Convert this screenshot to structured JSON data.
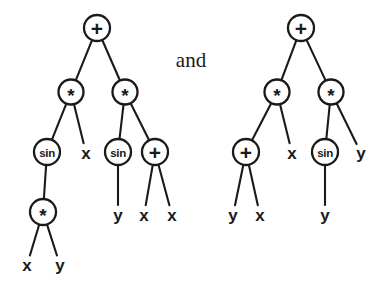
{
  "figure": {
    "caption_between": "and",
    "background_color": "#ffffff",
    "ink_color": "#1a1a1a",
    "trees": [
      {
        "id": "left-tree",
        "expression": "(+ (* (sin (* x y)) x) (* (sin y) (+ x x)))",
        "nodes": [
          {
            "id": "L0",
            "label": "+",
            "kind": "operator",
            "shape": "circle",
            "cx": 97,
            "cy": 28,
            "r": 13
          },
          {
            "id": "L1",
            "label": "*",
            "kind": "operator",
            "shape": "circle",
            "cx": 71,
            "cy": 92,
            "r": 12.5
          },
          {
            "id": "L2",
            "label": "*",
            "kind": "operator",
            "shape": "circle",
            "cx": 125,
            "cy": 92,
            "r": 12.5
          },
          {
            "id": "L3",
            "label": "sin",
            "kind": "operator",
            "shape": "circle",
            "cx": 47,
            "cy": 152,
            "r": 13
          },
          {
            "id": "L4",
            "label": "x",
            "kind": "terminal",
            "shape": "text",
            "cx": 86,
            "cy": 153
          },
          {
            "id": "L5",
            "label": "sin",
            "kind": "operator",
            "shape": "circle",
            "cx": 118,
            "cy": 152,
            "r": 13
          },
          {
            "id": "L6",
            "label": "+",
            "kind": "operator",
            "shape": "circle",
            "cx": 155,
            "cy": 152,
            "r": 13
          },
          {
            "id": "L7",
            "label": "*",
            "kind": "operator",
            "shape": "circle",
            "cx": 43,
            "cy": 212,
            "r": 13
          },
          {
            "id": "L8",
            "label": "y",
            "kind": "terminal",
            "shape": "text",
            "cx": 118,
            "cy": 215
          },
          {
            "id": "L9",
            "label": "x",
            "kind": "terminal",
            "shape": "text",
            "cx": 144,
            "cy": 215
          },
          {
            "id": "L10",
            "label": "x",
            "kind": "terminal",
            "shape": "text",
            "cx": 172,
            "cy": 215
          },
          {
            "id": "L11",
            "label": "x",
            "kind": "terminal",
            "shape": "text",
            "cx": 27,
            "cy": 265
          },
          {
            "id": "L12",
            "label": "y",
            "kind": "terminal",
            "shape": "text",
            "cx": 60,
            "cy": 265
          }
        ],
        "edges": [
          {
            "from": "L0",
            "to": "L1"
          },
          {
            "from": "L0",
            "to": "L2"
          },
          {
            "from": "L1",
            "to": "L3"
          },
          {
            "from": "L1",
            "to": "L4"
          },
          {
            "from": "L2",
            "to": "L5"
          },
          {
            "from": "L2",
            "to": "L6"
          },
          {
            "from": "L3",
            "to": "L7"
          },
          {
            "from": "L5",
            "to": "L8"
          },
          {
            "from": "L6",
            "to": "L9"
          },
          {
            "from": "L6",
            "to": "L10"
          },
          {
            "from": "L7",
            "to": "L11"
          },
          {
            "from": "L7",
            "to": "L12"
          }
        ]
      },
      {
        "id": "right-tree",
        "expression": "(+ (* (+ y x) x) (* (sin y) y))",
        "nodes": [
          {
            "id": "R0",
            "label": "+",
            "kind": "operator",
            "shape": "circle",
            "cx": 301,
            "cy": 28,
            "r": 13
          },
          {
            "id": "R1",
            "label": "*",
            "kind": "operator",
            "shape": "circle",
            "cx": 277,
            "cy": 92,
            "r": 12.5
          },
          {
            "id": "R2",
            "label": "*",
            "kind": "operator",
            "shape": "circle",
            "cx": 331,
            "cy": 92,
            "r": 12.5
          },
          {
            "id": "R3",
            "label": "+",
            "kind": "operator",
            "shape": "circle",
            "cx": 246,
            "cy": 152,
            "r": 13
          },
          {
            "id": "R4",
            "label": "x",
            "kind": "terminal",
            "shape": "text",
            "cx": 292,
            "cy": 153
          },
          {
            "id": "R5",
            "label": "sin",
            "kind": "operator",
            "shape": "circle",
            "cx": 325,
            "cy": 152,
            "r": 13
          },
          {
            "id": "R6",
            "label": "y",
            "kind": "terminal",
            "shape": "text",
            "cx": 361,
            "cy": 153
          },
          {
            "id": "R7",
            "label": "y",
            "kind": "terminal",
            "shape": "text",
            "cx": 233,
            "cy": 215
          },
          {
            "id": "R8",
            "label": "x",
            "kind": "terminal",
            "shape": "text",
            "cx": 260,
            "cy": 215
          },
          {
            "id": "R9",
            "label": "y",
            "kind": "terminal",
            "shape": "text",
            "cx": 325,
            "cy": 215
          }
        ],
        "edges": [
          {
            "from": "R0",
            "to": "R1"
          },
          {
            "from": "R0",
            "to": "R2"
          },
          {
            "from": "R1",
            "to": "R3"
          },
          {
            "from": "R1",
            "to": "R4"
          },
          {
            "from": "R2",
            "to": "R5"
          },
          {
            "from": "R2",
            "to": "R6"
          },
          {
            "from": "R3",
            "to": "R7"
          },
          {
            "from": "R3",
            "to": "R8"
          },
          {
            "from": "R5",
            "to": "R9"
          }
        ]
      }
    ],
    "conjunction_position": {
      "cx": 191,
      "cy": 60
    }
  }
}
